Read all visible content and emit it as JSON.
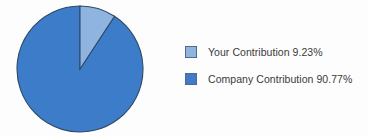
{
  "chart_data": {
    "type": "pie",
    "title": "",
    "xlabel": "",
    "ylabel": "",
    "categories": [
      "Your Contribution",
      "Company Contribution"
    ],
    "values": [
      9.23,
      90.77
    ],
    "value_unit": "%",
    "labels_on_slices": false,
    "grid": false,
    "legend_position": "right",
    "start_angle_deg": 0,
    "direction": "clockwise",
    "colors": [
      "#8fb4e0",
      "#3d7cc9"
    ],
    "slice_border_color": "#2e4a6b",
    "background_color": "#fdfdfd",
    "series": [
      {
        "name": "Contribution Split",
        "points": [
          {
            "label": "Your Contribution",
            "value": 9.23,
            "color": "#8fb4e0"
          },
          {
            "label": "Company Contribution",
            "value": 90.77,
            "color": "#3d7cc9"
          }
        ]
      }
    ]
  },
  "legend": {
    "items": [
      {
        "label": "Your Contribution 9.23%",
        "name": "Your Contribution",
        "value": "9.23%",
        "color": "#8fb4e0"
      },
      {
        "label": "Company Contribution 90.77%",
        "name": "Company Contribution",
        "value": "90.77%",
        "color": "#3d7cc9"
      }
    ]
  }
}
